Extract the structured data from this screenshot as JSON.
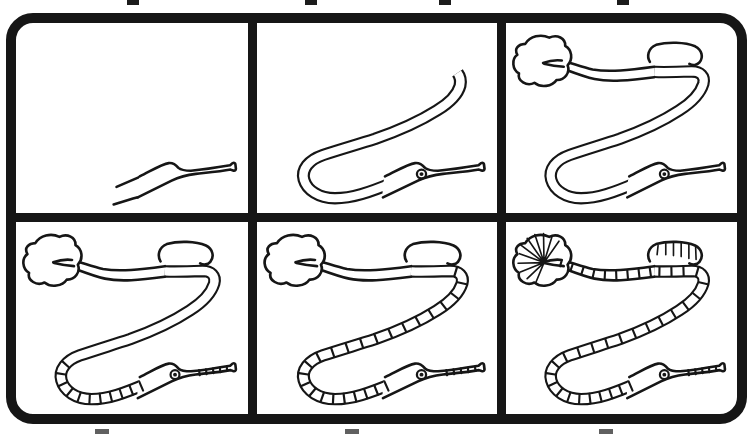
{
  "document": {
    "title": "Six-step pipefish drawing worksheet",
    "subject": "pipefish",
    "style": "black ink line art on white paper",
    "grid": {
      "rows": 2,
      "cols": 3,
      "panel_count": 6
    }
  },
  "colors": {
    "ink": "#161616",
    "paper": "#ffffff",
    "frame": "#161616"
  },
  "frame": {
    "border_radius_px": 27,
    "border_thickness_px": 10,
    "divider_thickness_px": 9
  },
  "panels": [
    {
      "index": 1,
      "step": 1,
      "label": "Step 1: open outline of the snout and head",
      "drawn_elements": [
        "snout outline",
        "trumpet mouth tip"
      ],
      "features": {
        "sketch_extension": true,
        "head": true,
        "eye": false,
        "body_partial": false,
        "body_full": false,
        "tail": false,
        "dorsal_fin": false,
        "tail_fin": false,
        "segments_lower": false,
        "segments_mid": false,
        "segments_top": false,
        "snout_segments": false,
        "fin_rays": false,
        "dorsal_ticks": false
      }
    },
    {
      "index": 2,
      "step": 2,
      "label": "Step 2: head with eye and front body curve ending open at the top",
      "drawn_elements": [
        "head",
        "eye",
        "snout tip",
        "lower body loop",
        "rising body band"
      ],
      "features": {
        "sketch_extension": false,
        "head": true,
        "eye": true,
        "body_partial": true,
        "body_full": false,
        "tail": false,
        "dorsal_fin": false,
        "tail_fin": false,
        "segments_lower": false,
        "segments_mid": false,
        "segments_top": false,
        "snout_segments": false,
        "fin_rays": false,
        "dorsal_ticks": false
      }
    },
    {
      "index": 3,
      "step": 3,
      "label": "Step 3: complete S-curved body with dorsal fin flap and lumpy tail fin",
      "drawn_elements": [
        "full body S-curve",
        "dorsal fin flap",
        "tail fin blob",
        "tail taper"
      ],
      "features": {
        "sketch_extension": false,
        "head": true,
        "eye": true,
        "body_partial": false,
        "body_full": true,
        "tail": true,
        "dorsal_fin": true,
        "tail_fin": true,
        "segments_lower": false,
        "segments_mid": false,
        "segments_top": false,
        "snout_segments": false,
        "fin_rays": false,
        "dorsal_ticks": false
      }
    },
    {
      "index": 4,
      "step": 4,
      "label": "Step 4: segment rings added on belly loop and snout",
      "drawn_elements": [
        "belly segment rings",
        "snout rings"
      ],
      "features": {
        "sketch_extension": false,
        "head": true,
        "eye": true,
        "body_partial": false,
        "body_full": true,
        "tail": true,
        "dorsal_fin": true,
        "tail_fin": true,
        "segments_lower": true,
        "segments_mid": false,
        "segments_top": false,
        "snout_segments": true,
        "fin_rays": false,
        "dorsal_ticks": false
      }
    },
    {
      "index": 5,
      "step": 5,
      "label": "Step 5: segment rings continued up the middle of the body",
      "drawn_elements": [
        "mid-body segment rings"
      ],
      "features": {
        "sketch_extension": false,
        "head": true,
        "eye": true,
        "body_partial": false,
        "body_full": true,
        "tail": true,
        "dorsal_fin": true,
        "tail_fin": true,
        "segments_lower": true,
        "segments_mid": true,
        "segments_top": false,
        "snout_segments": true,
        "fin_rays": false,
        "dorsal_ticks": false
      }
    },
    {
      "index": 6,
      "step": 6,
      "label": "Step 6: finished pipefish with upper segments, tail-fin rays and dorsal fin lines",
      "drawn_elements": [
        "upper body segment rings",
        "tail-fin rays",
        "dorsal fin lines"
      ],
      "features": {
        "sketch_extension": false,
        "head": true,
        "eye": true,
        "body_partial": false,
        "body_full": true,
        "tail": true,
        "dorsal_fin": true,
        "tail_fin": true,
        "segments_lower": true,
        "segments_mid": true,
        "segments_top": true,
        "snout_segments": true,
        "fin_rays": true,
        "dorsal_ticks": true
      }
    }
  ],
  "scan_artifacts": {
    "top_ticks_x": [
      127,
      305,
      439,
      617
    ],
    "bottom_ticks_x": [
      95,
      345,
      599
    ]
  }
}
